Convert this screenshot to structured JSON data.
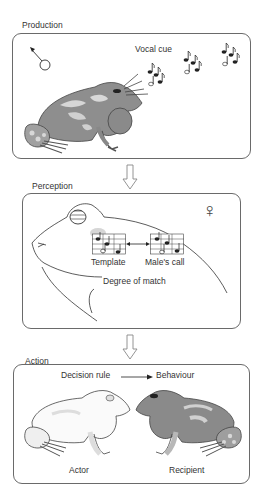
{
  "stages": {
    "production": {
      "label": "Production",
      "vocal_cue": "Vocal cue"
    },
    "perception": {
      "label": "Perception",
      "template": "Template",
      "males_call": "Male's call",
      "degree_of_match": "Degree of match",
      "sex_symbol": "♀"
    },
    "action": {
      "label": "Action",
      "decision_rule": "Decision rule",
      "behaviour": "Behaviour",
      "actor": "Actor",
      "recipient": "Recipient"
    }
  },
  "colors": {
    "border": "#6a6a6a",
    "frog_dark": "#8a8a8a",
    "frog_light": "#c8c8c8",
    "outline": "#444444"
  }
}
